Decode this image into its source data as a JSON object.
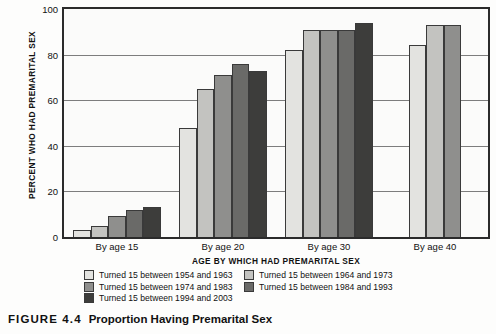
{
  "caption": {
    "figure_number": "FIGURE 4.4",
    "title": "Proportion Having Premarital Sex"
  },
  "chart_data": {
    "type": "bar",
    "title": "Proportion Having Premarital Sex",
    "xlabel": "AGE BY WHICH HAD PREMARITAL SEX",
    "ylabel": "PERCENT WHO HAD PREMARITAL SEX",
    "ylim": [
      0,
      100
    ],
    "yticks": [
      0,
      20,
      40,
      60,
      80,
      100
    ],
    "ytick_labels": [
      "0",
      "20",
      "40",
      "60",
      "80",
      "100"
    ],
    "grid": true,
    "legend_position": "bottom",
    "categories": [
      "By age 15",
      "By age 20",
      "By age 30",
      "By age 40"
    ],
    "series": [
      {
        "name": "Turned 15 between 1954 and 1963",
        "color": "#e3e3e0",
        "values": [
          3,
          48,
          82,
          84
        ]
      },
      {
        "name": "Turned 15 between 1964 and 1973",
        "color": "#c3c3c0",
        "values": [
          5,
          65,
          91,
          93
        ]
      },
      {
        "name": "Turned 15 between 1974 and 1983",
        "color": "#8f8f8d",
        "values": [
          9,
          71,
          91,
          93
        ]
      },
      {
        "name": "Turned 15 between 1984 and 1993",
        "color": "#6a6a68",
        "values": [
          12,
          76,
          91,
          null
        ]
      },
      {
        "name": "Turned 15 between 1994 and 2003",
        "color": "#3d3d3b",
        "values": [
          13,
          73,
          94,
          null
        ]
      }
    ]
  },
  "legend": {
    "items": [
      {
        "label": "Turned 15 between 1954 and 1963",
        "color": "#e3e3e0"
      },
      {
        "label": "Turned 15 between 1964 and 1973",
        "color": "#c3c3c0"
      },
      {
        "label": "Turned 15 between 1974 and 1983",
        "color": "#8f8f8d"
      },
      {
        "label": "Turned 15 between 1984 and 1993",
        "color": "#6a6a68"
      },
      {
        "label": "Turned 15 between 1994 and 2003",
        "color": "#3d3d3b"
      }
    ]
  }
}
